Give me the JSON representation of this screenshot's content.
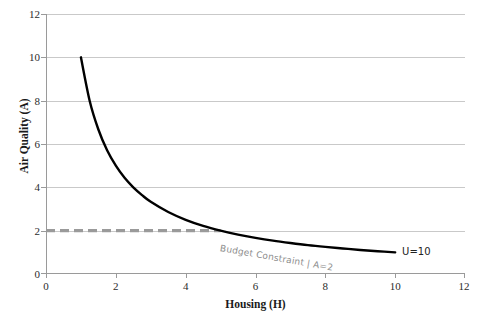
{
  "chart_data": {
    "type": "line",
    "title": "",
    "xlabel": "Housing (H)",
    "ylabel": "Air Quality (A)",
    "xlim": [
      0,
      12
    ],
    "ylim": [
      0,
      12
    ],
    "xticks": [
      "0",
      "2",
      "4",
      "6",
      "8",
      "10",
      "12"
    ],
    "yticks": [
      "0",
      "2",
      "4",
      "6",
      "8",
      "10",
      "12"
    ],
    "grid": "horizontal",
    "legend": "none",
    "series": [
      {
        "name": "U=10",
        "kind": "indifference-curve",
        "style": "solid",
        "color": "#000000",
        "equation": "A = 10 / H",
        "x": [
          1.0,
          1.25,
          1.5,
          1.75,
          2.0,
          2.25,
          2.5,
          2.75,
          3.0,
          3.5,
          4.0,
          4.5,
          5.0,
          5.5,
          6.0,
          6.5,
          7.0,
          7.5,
          8.0,
          8.5,
          9.0,
          9.5,
          10.0
        ],
        "values": [
          10.0,
          8.0,
          6.67,
          5.71,
          5.0,
          4.44,
          4.0,
          3.64,
          3.33,
          2.86,
          2.5,
          2.22,
          2.0,
          1.82,
          1.67,
          1.54,
          1.43,
          1.33,
          1.25,
          1.18,
          1.11,
          1.05,
          1.0
        ]
      },
      {
        "name": "Budget Constraint | A=2",
        "kind": "budget-constraint",
        "style": "dashed",
        "color": "#9a9a9a",
        "equation": "A = 2",
        "x": [
          0,
          5
        ],
        "values": [
          2,
          2
        ]
      }
    ],
    "annotations": [
      {
        "id": "budget-label",
        "text": "Budget Constraint | A=2",
        "x": 5.0,
        "y": 1.45,
        "rotation": 10,
        "color": "#8d8d8d"
      },
      {
        "id": "curve-label",
        "text": "U=10",
        "x": 10.2,
        "y": 1.3,
        "rotation": 0,
        "color": "#222222"
      }
    ],
    "intersection": {
      "x": 5.0,
      "y": 2.0
    }
  }
}
